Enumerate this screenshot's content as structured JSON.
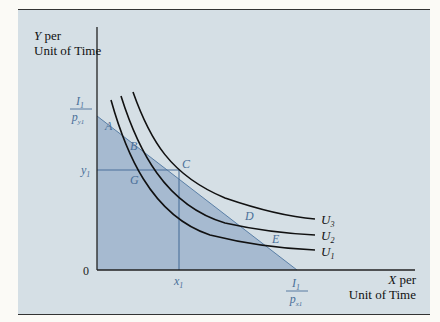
{
  "diagram": {
    "type": "indifference-curves-budget-constraint",
    "y_axis_label": {
      "var": "Y",
      "line1_rest": " per",
      "line2": "Unit of Time"
    },
    "x_axis_label": {
      "var": "X",
      "line1_rest": " per",
      "line2": "Unit of Time"
    },
    "origin_label": "0",
    "y_intercept_label": {
      "num": "I",
      "num_sub": "1",
      "den": "p",
      "den_sub": "y1"
    },
    "x_intercept_label": {
      "num": "I",
      "num_sub": "1",
      "den": "p",
      "den_sub": "x1"
    },
    "y1_label": {
      "var": "y",
      "sub": "1"
    },
    "x1_label": {
      "var": "x",
      "sub": "1"
    },
    "points": {
      "A": "A",
      "B": "B",
      "C": "C",
      "D": "D",
      "E": "E",
      "G": "G"
    },
    "curves": [
      {
        "name": "U",
        "sub": "3"
      },
      {
        "name": "U",
        "sub": "2"
      },
      {
        "name": "U",
        "sub": "1"
      }
    ],
    "colors": {
      "background": "#d5dfe5",
      "budget_fill": "#9db4cc",
      "budget_line": "#5a7fa6",
      "label_blue": "#4a6f99",
      "curve": "#111111",
      "axis": "#222222"
    }
  }
}
